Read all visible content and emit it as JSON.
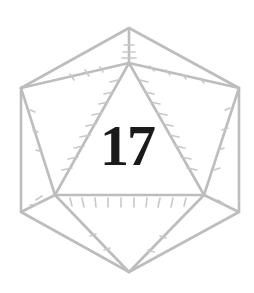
{
  "die": {
    "type": "d20",
    "face_value": "17",
    "line_color": "#bdbdbd",
    "number_color": "#1a1a1a"
  }
}
